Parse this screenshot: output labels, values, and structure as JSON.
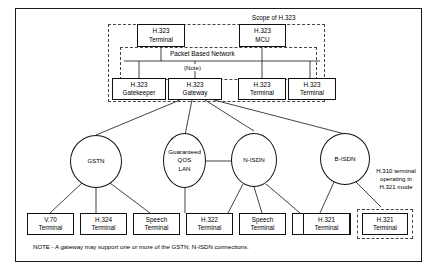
{
  "figure": {
    "scope_label": "Scope of H.323",
    "packet_network_label": "Packet Based Network",
    "note_tag": "(Note)",
    "note_text": "NOTE - A gateway may support one or more of the GSTN, N-ISDN connections.",
    "h310_annotation": "H.310 terminal operating in H.321 mode"
  },
  "top_nodes": [
    {
      "line1": "H.323",
      "line2": "Terminal"
    },
    {
      "line1": "H.323",
      "line2": "MCU"
    }
  ],
  "bottom_nodes": [
    {
      "line1": "H.323",
      "line2": "Gatekeeper"
    },
    {
      "line1": "H.323",
      "line2": "Gateway"
    },
    {
      "line1": "H.323",
      "line2": "Terminal"
    },
    {
      "line1": "H.323",
      "line2": "Terminal"
    }
  ],
  "networks": [
    {
      "lines": [
        "GSTN"
      ]
    },
    {
      "lines": [
        "Guaranteed",
        "QOS",
        "LAN"
      ]
    },
    {
      "lines": [
        "N-ISDN"
      ]
    },
    {
      "lines": [
        "B-ISDN"
      ]
    }
  ],
  "terminals": [
    {
      "line1": "V.70",
      "line2": "Terminal"
    },
    {
      "line1": "H.324",
      "line2": "Terminal"
    },
    {
      "line1": "Speech",
      "line2": "Terminal"
    },
    {
      "line1": "H.322",
      "line2": "Terminal"
    },
    {
      "line1": "Speech",
      "line2": "Terminal"
    },
    {
      "line1": "H.320",
      "line2": "Terminal"
    },
    {
      "line1": "H.321",
      "line2": "Terminal"
    },
    {
      "line1": "H.321",
      "line2": "Terminal"
    }
  ],
  "colors": {
    "stroke": "#111111",
    "dashed": "#444444",
    "background": "#ffffff"
  }
}
